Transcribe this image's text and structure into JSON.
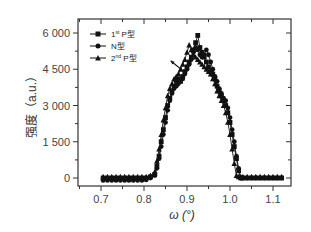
{
  "chart_data": {
    "type": "line",
    "title": "",
    "xlabel": "ω (°)",
    "ylabel": "强度 (a.u.)",
    "xlim": [
      0.66,
      1.14
    ],
    "ylim": [
      -500,
      6600
    ],
    "xticks": [
      0.7,
      0.8,
      0.9,
      1.0,
      1.1
    ],
    "xtick_labels": [
      "0.7",
      "0.8",
      "0.9",
      "1.0",
      "1.1"
    ],
    "yticks": [
      0,
      1500,
      3000,
      4500,
      6000
    ],
    "ytick_labels": [
      "0",
      "1 500",
      "3 000",
      "4 500",
      "6 000"
    ],
    "grid": false,
    "legend_position": "upper left",
    "annotations": [
      {
        "type": "arrow",
        "from": [
          0.893,
          4400
        ],
        "to": [
          0.862,
          4850
        ]
      }
    ],
    "series": [
      {
        "name": "1st P型",
        "marker": "square",
        "x": [
          0.705,
          0.715,
          0.725,
          0.735,
          0.745,
          0.755,
          0.765,
          0.775,
          0.785,
          0.795,
          0.805,
          0.815,
          0.825,
          0.83,
          0.835,
          0.84,
          0.845,
          0.85,
          0.855,
          0.86,
          0.865,
          0.87,
          0.875,
          0.88,
          0.885,
          0.89,
          0.895,
          0.9,
          0.905,
          0.91,
          0.915,
          0.92,
          0.925,
          0.93,
          0.935,
          0.94,
          0.945,
          0.95,
          0.955,
          0.96,
          0.965,
          0.97,
          0.975,
          0.98,
          0.985,
          0.99,
          0.995,
          1.0,
          1.005,
          1.01,
          1.015,
          1.02,
          1.025,
          1.03,
          1.04,
          1.05,
          1.06,
          1.07,
          1.08,
          1.09,
          1.1,
          1.11,
          1.12
        ],
        "y": [
          0,
          0,
          0,
          0,
          0,
          0,
          0,
          0,
          0,
          0,
          0,
          50,
          150,
          500,
          900,
          1500,
          2000,
          2500,
          3000,
          3300,
          3600,
          3800,
          4000,
          4100,
          4000,
          4200,
          4400,
          4600,
          4800,
          5000,
          5300,
          5600,
          5900,
          5400,
          5200,
          5000,
          4800,
          4600,
          4400,
          4300,
          4100,
          3800,
          3600,
          3400,
          3200,
          3000,
          2700,
          2300,
          1800,
          1300,
          800,
          300,
          0,
          0,
          0,
          0,
          0,
          0,
          0,
          0,
          0,
          0,
          0
        ]
      },
      {
        "name": "N型",
        "marker": "circle",
        "x": [
          0.705,
          0.715,
          0.725,
          0.735,
          0.745,
          0.755,
          0.765,
          0.775,
          0.785,
          0.795,
          0.805,
          0.815,
          0.825,
          0.83,
          0.835,
          0.84,
          0.845,
          0.85,
          0.855,
          0.86,
          0.865,
          0.87,
          0.875,
          0.88,
          0.885,
          0.89,
          0.895,
          0.9,
          0.905,
          0.91,
          0.915,
          0.92,
          0.925,
          0.93,
          0.935,
          0.94,
          0.945,
          0.95,
          0.955,
          0.96,
          0.965,
          0.97,
          0.975,
          0.98,
          0.985,
          0.99,
          0.995,
          1.0,
          1.005,
          1.01,
          1.015,
          1.02,
          1.025,
          1.03,
          1.04,
          1.05,
          1.06,
          1.07,
          1.08,
          1.09,
          1.1,
          1.11,
          1.12
        ],
        "y": [
          -100,
          -100,
          -100,
          -100,
          -100,
          -100,
          -100,
          -100,
          -100,
          -100,
          -80,
          0,
          100,
          400,
          800,
          1300,
          1800,
          2300,
          2800,
          3200,
          3500,
          3700,
          3800,
          3900,
          4000,
          4100,
          4300,
          4500,
          4700,
          4900,
          5200,
          5400,
          5300,
          5100,
          5000,
          5100,
          5300,
          5100,
          4800,
          4500,
          4200,
          4000,
          3700,
          3500,
          3300,
          3200,
          2900,
          2500,
          2000,
          1500,
          900,
          400,
          0,
          0,
          0,
          0,
          0,
          0,
          0,
          0,
          0,
          0,
          0
        ]
      },
      {
        "name": "2nd P型",
        "marker": "triangle",
        "x": [
          0.705,
          0.715,
          0.725,
          0.735,
          0.745,
          0.755,
          0.765,
          0.775,
          0.785,
          0.795,
          0.805,
          0.815,
          0.825,
          0.83,
          0.835,
          0.84,
          0.845,
          0.85,
          0.855,
          0.86,
          0.865,
          0.87,
          0.875,
          0.88,
          0.885,
          0.89,
          0.895,
          0.9,
          0.905,
          0.91,
          0.915,
          0.92,
          0.925,
          0.93,
          0.935,
          0.94,
          0.945,
          0.95,
          0.955,
          0.96,
          0.965,
          0.97,
          0.975,
          0.98,
          0.985,
          0.99,
          0.995,
          1.0,
          1.005,
          1.01,
          1.015,
          1.02,
          1.025,
          1.03,
          1.04,
          1.05,
          1.06,
          1.07,
          1.08,
          1.09,
          1.1,
          1.11,
          1.12
        ],
        "y": [
          50,
          50,
          50,
          50,
          50,
          50,
          50,
          50,
          50,
          50,
          50,
          100,
          250,
          700,
          1200,
          1800,
          2400,
          2900,
          3400,
          3700,
          3900,
          4100,
          4200,
          4300,
          4500,
          4700,
          4900,
          5200,
          5500,
          5300,
          5100,
          5000,
          4900,
          4800,
          4700,
          4600,
          4500,
          4400,
          4300,
          4100,
          3900,
          3600,
          3400,
          3200,
          3000,
          2700,
          2300,
          1800,
          1200,
          600,
          100,
          50,
          50,
          50,
          50,
          50,
          50,
          50,
          50,
          50,
          50,
          50,
          50
        ]
      }
    ]
  },
  "legend": {
    "items": [
      {
        "label_main": "1",
        "label_sup": "st",
        "label_rest": " P型",
        "marker": "square"
      },
      {
        "label_main": "N型",
        "label_sup": "",
        "label_rest": "",
        "marker": "circle"
      },
      {
        "label_main": "2",
        "label_sup": "nd",
        "label_rest": " P型",
        "marker": "triangle"
      }
    ]
  },
  "axes": {
    "x_title": "ω (°)",
    "y_title": "强度（a.u.）",
    "colors": {
      "frame": "#333333",
      "series": "#111111",
      "text": "#444444"
    }
  }
}
